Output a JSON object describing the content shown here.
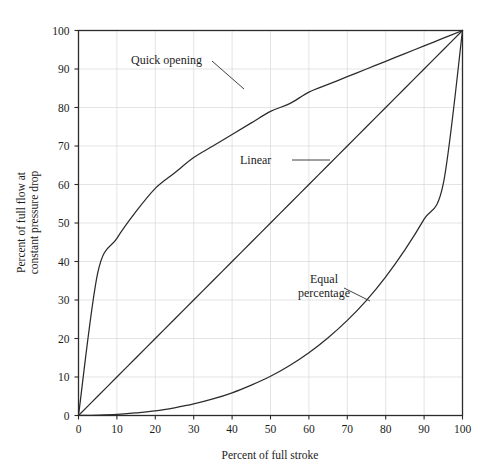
{
  "figure": {
    "background_color": "#ffffff",
    "ink_color": "#2b2b2b",
    "grid_color": "#d9d9dd"
  },
  "chart_data": {
    "type": "line",
    "title": "",
    "xlabel": "Percent of full stroke",
    "ylabel": "Percent of full flow at constant pressure drop",
    "xlim": [
      0,
      100
    ],
    "ylim": [
      0,
      100
    ],
    "grid": true,
    "legend_position": "inline-annotations",
    "xticks": [
      0,
      10,
      20,
      30,
      40,
      50,
      60,
      70,
      80,
      90,
      100
    ],
    "yticks": [
      0,
      10,
      20,
      30,
      40,
      50,
      60,
      70,
      80,
      90,
      100
    ],
    "xticklabels": [
      "0",
      "10",
      "20",
      "30",
      "40",
      "50",
      "60",
      "70",
      "80",
      "90",
      "100"
    ],
    "yticklabels": [
      "0",
      "10",
      "20",
      "30",
      "40",
      "50",
      "60",
      "70",
      "80",
      "90",
      "100"
    ],
    "x": [
      0,
      5,
      10,
      15,
      20,
      25,
      30,
      35,
      40,
      45,
      50,
      55,
      60,
      65,
      70,
      75,
      80,
      85,
      90,
      95,
      100
    ],
    "series": [
      {
        "name": "Quick opening",
        "values": [
          0,
          37,
          46,
          53,
          59,
          63,
          67,
          70,
          73,
          76,
          79,
          81,
          84,
          86,
          88,
          90,
          92,
          94,
          96,
          98,
          100
        ]
      },
      {
        "name": "Linear",
        "values": [
          0,
          5,
          10,
          15,
          20,
          25,
          30,
          35,
          40,
          45,
          50,
          55,
          60,
          65,
          70,
          75,
          80,
          85,
          90,
          95,
          100
        ]
      },
      {
        "name": "Equal percentage",
        "values": [
          0,
          0.1,
          0.3,
          0.7,
          1.2,
          2.0,
          3.0,
          4.3,
          5.9,
          7.9,
          10.2,
          13.0,
          16.3,
          20.2,
          24.7,
          29.9,
          36.0,
          43.0,
          51.0,
          60.2,
          100
        ]
      }
    ],
    "annotations": [
      {
        "id": "quick-opening",
        "text": "Quick opening",
        "text_lines": [
          "Quick opening"
        ],
        "data_point": [
          43,
          85
        ]
      },
      {
        "id": "linear",
        "text": "Linear",
        "text_lines": [
          "Linear"
        ],
        "data_point": [
          65,
          65
        ]
      },
      {
        "id": "equal-percentage",
        "text": "Equal percentage",
        "text_lines": [
          "Equal",
          "percentage"
        ],
        "data_point": [
          75,
          30
        ]
      }
    ]
  }
}
